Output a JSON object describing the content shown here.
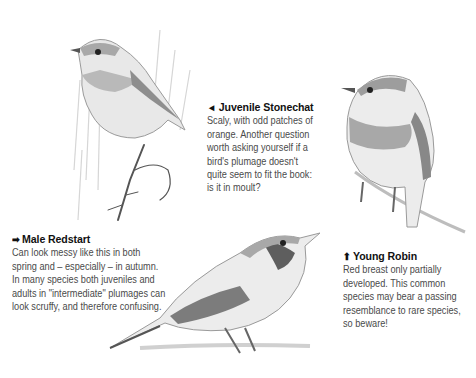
{
  "captions": {
    "stonechat": {
      "arrow": "◄",
      "arrow_icon": "arrow-left-icon",
      "title": "Juvenile Stonechat",
      "lines": [
        "Scaly, with odd patches of",
        "orange. Another question",
        "worth asking yourself if a",
        "bird's plumage doesn't",
        "quite seem to fit the book:",
        "is it in moult?"
      ]
    },
    "redstart": {
      "arrow": "➡",
      "arrow_icon": "arrow-right-icon",
      "title": "Male Redstart",
      "lines": [
        "Can look messy like this in both",
        "spring and – especially – in autumn.",
        "In many species both juveniles and",
        "adults in \"intermediate\" plumages can",
        "look scruffy, and therefore confusing."
      ]
    },
    "robin": {
      "arrow": "⬆",
      "arrow_icon": "arrow-up-icon",
      "title": "Young Robin",
      "lines": [
        "Red breast only partially",
        "developed. This common",
        "species may bear a passing",
        "resemblance to rare species,",
        "so beware!"
      ]
    }
  },
  "illustrations": [
    {
      "name": "juvenile-stonechat",
      "position": "top-left"
    },
    {
      "name": "male-redstart",
      "position": "bottom-center"
    },
    {
      "name": "young-robin",
      "position": "right"
    }
  ],
  "colors": {
    "background": "#ffffff",
    "title_text": "#111111",
    "body_text": "#4a4a4a"
  }
}
